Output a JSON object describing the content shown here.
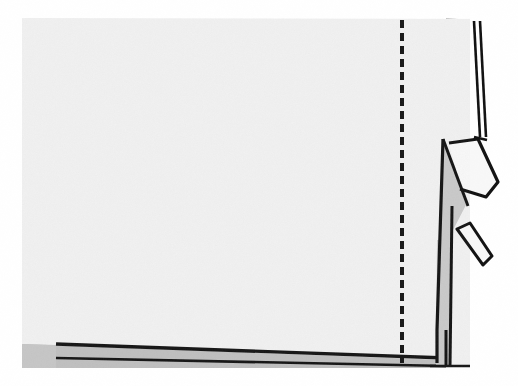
{
  "figure": {
    "kind": "line-art-scan",
    "width": 518,
    "height": 386,
    "background_color": "#ffffff",
    "paper_color": "#f2f2f2",
    "ink_color": "#111111",
    "shadow_gray": "#b8b8b8",
    "mid_gray": "#c9c9c9",
    "alt_text": "Black and white scanned illustration of a fabric panel: a large pale rectangle with a vertical dashed stitching line near the right edge, a folded-back corner forming a gray triangular wedge with two pointed flaps extending to the right, and a narrow gray shadow wedge along the bottom edge."
  },
  "regions": {
    "panel": {
      "name": "main-fabric-panel",
      "fill": "#f2f2f2",
      "x": 22,
      "y": 18,
      "width": 448,
      "height": 350
    },
    "stitch_line": {
      "name": "dashed-basting-line",
      "label": "basting stitch line",
      "x": 402,
      "y_start": 20,
      "y_end": 363,
      "dash": 8,
      "gap": 5,
      "stroke_width": 4,
      "color": "#161616"
    },
    "fold_wedge": {
      "name": "folded-corner-wedge",
      "fill": "#c9c9c9",
      "apex_x": 443,
      "apex_y": 139
    },
    "upper_flap": {
      "name": "upper-corner-flap",
      "fill": "#f7f7f7",
      "angle_note": "angled down and to the right"
    },
    "lower_flap": {
      "name": "lower-corner-flap",
      "fill": "#f7f7f7",
      "angle_note": "narrow strip angled down and to the right"
    },
    "edge_lines": {
      "name": "double-selvage-line",
      "count": 2,
      "x_top": 474,
      "x_bottom": 480,
      "y_start": 20,
      "y_end": 137
    },
    "bottom_shadow": {
      "name": "bottom-shadow-wedge",
      "fill": "#bdbdbd",
      "left_x": 22,
      "right_x": 446,
      "top_y_left": 344,
      "top_y_right": 360
    },
    "right_shadow": {
      "name": "right-edge-shadow",
      "fill": "#bebebe",
      "x": 447,
      "y": 18,
      "width": 23,
      "height": 350
    }
  }
}
